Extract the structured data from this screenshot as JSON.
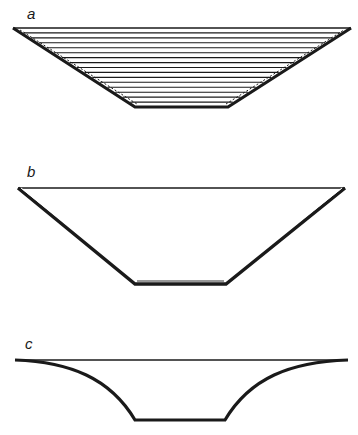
{
  "figure": {
    "panels": [
      {
        "label": "a",
        "description": "Trapezoidal channel cross-section filled with horizontal hatching lines",
        "shape": "trapezoid",
        "fill": "horizontal-hatch",
        "hatch_line_count": 15
      },
      {
        "label": "b",
        "description": "Empty trapezoidal channel cross-section with double-lined walls",
        "shape": "trapezoid",
        "fill": "none"
      },
      {
        "label": "c",
        "description": "Channel cross-section with concave curved walls and flat bottom",
        "shape": "curved-profile",
        "fill": "none"
      }
    ]
  },
  "colors": {
    "stroke": "#1a1a1a",
    "background": "#ffffff"
  }
}
